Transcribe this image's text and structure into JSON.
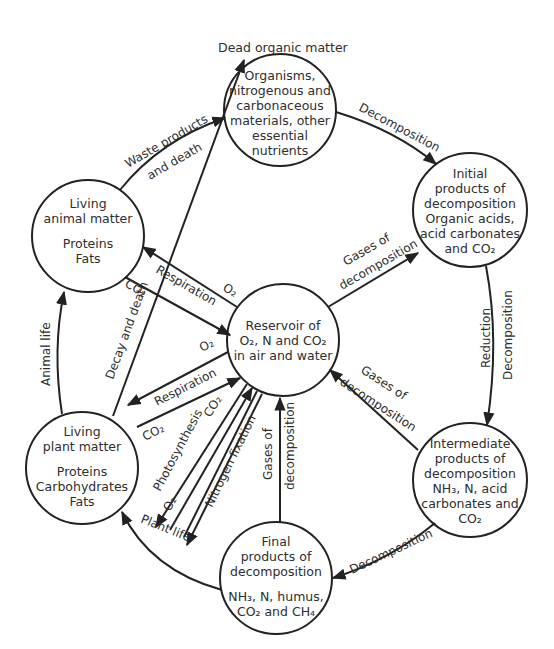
{
  "title": "Dead organic matter",
  "nodes": {
    "dead": {
      "lines": [
        "Organisms,",
        "nitrogenous and",
        "carbonaceous",
        "materials, other",
        "essential",
        "nutrients"
      ]
    },
    "initial": {
      "lines": [
        "Initial",
        "products of",
        "decomposition",
        "Organic acids,",
        "acid carbonates",
        "and CO₂"
      ]
    },
    "intermediate": {
      "lines": [
        "Intermediate",
        "products of",
        "decomposition",
        "NH₃, N, acid",
        "carbonates and",
        "CO₂"
      ]
    },
    "final": {
      "lines_a": [
        "Final",
        "products of",
        "decomposition"
      ],
      "lines_b": [
        "NH₃, N, humus,",
        "CO₂ and CH₄"
      ]
    },
    "plant": {
      "lines_a": [
        "Living",
        "plant matter"
      ],
      "lines_b": [
        "Proteins",
        "Carbohydrates",
        "Fats"
      ]
    },
    "animal": {
      "lines_a": [
        "Living",
        "animal matter"
      ],
      "lines_b": [
        "Proteins",
        "Fats"
      ]
    },
    "reservoir": {
      "lines": [
        "Reservoir of",
        "O₂, N and CO₂",
        "in air and water"
      ]
    }
  },
  "edges": {
    "waste_1": "Waste products",
    "waste_2": "and death",
    "decomp_top": "Decomposition",
    "reduction": "Reduction",
    "decomp_right": "Decomposition",
    "decomp_bottom": "Decomposition",
    "gases_1a": "Gases of",
    "gases_1b": "decomposition",
    "gases_2a": "Gases of",
    "gases_2b": "decomposition",
    "gases_3a": "Gases of",
    "gases_3b": "decomposition",
    "respiration_animal": "Respiration",
    "o2_animal": "O₂",
    "co2_animal": "CO₂",
    "decay_death": "Decay and death",
    "respiration_plant": "Respiration",
    "o2_plant": "O₂",
    "co2_plant": "CO₂",
    "photosynthesis": "Photosynthesis",
    "co2_photo": "CO₂",
    "o2_photo": "O₂",
    "nitrogen_fixation": "Nitrogen fixation",
    "plant_life": "Plant life",
    "animal_life": "Animal life"
  }
}
